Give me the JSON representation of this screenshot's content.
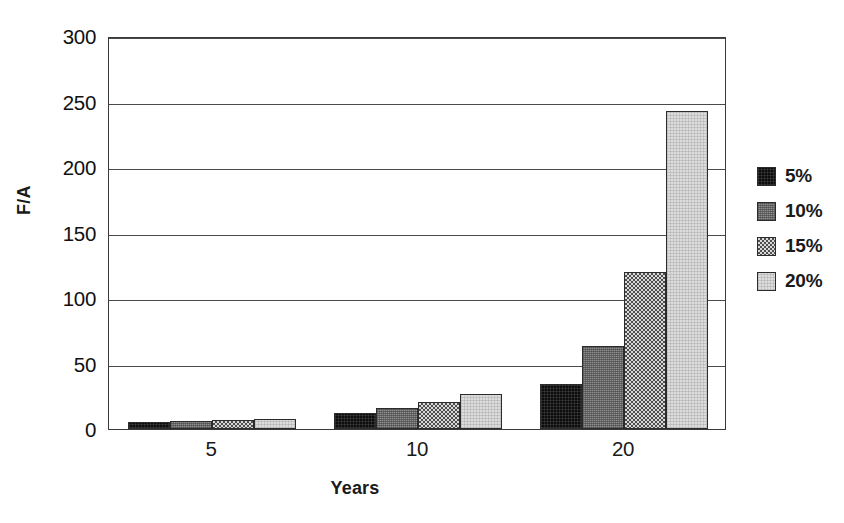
{
  "chart_data": {
    "type": "bar",
    "title": "",
    "subtitle": "",
    "xlabel": "Years",
    "ylabel": "F/A",
    "categories": [
      "5",
      "10",
      "20"
    ],
    "series": [
      {
        "name": "5%",
        "values": [
          5.5,
          12.6,
          34.0
        ],
        "swatch": "solid-black"
      },
      {
        "name": "10%",
        "values": [
          6.1,
          16.0,
          63.0
        ],
        "swatch": "dense-crosshatch-gray"
      },
      {
        "name": "15%",
        "values": [
          6.8,
          20.5,
          120.0
        ],
        "swatch": "checkerboard-gray"
      },
      {
        "name": "20%",
        "values": [
          7.5,
          26.5,
          243.0
        ],
        "swatch": "light-gray"
      }
    ],
    "ylim": [
      0,
      300
    ],
    "yticks": [
      0,
      50,
      100,
      150,
      200,
      250,
      300
    ],
    "ytick_labels": [
      "0",
      "50",
      "100",
      "150",
      "200",
      "250",
      "300"
    ],
    "xtick_labels": [
      "5",
      "10",
      "20"
    ],
    "grid": "horizontal",
    "legend_position": "right",
    "legend_entries": [
      "5%",
      "10%",
      "15%",
      "20%"
    ]
  },
  "axes": {
    "y_label": "F/A",
    "x_label": "Years"
  }
}
